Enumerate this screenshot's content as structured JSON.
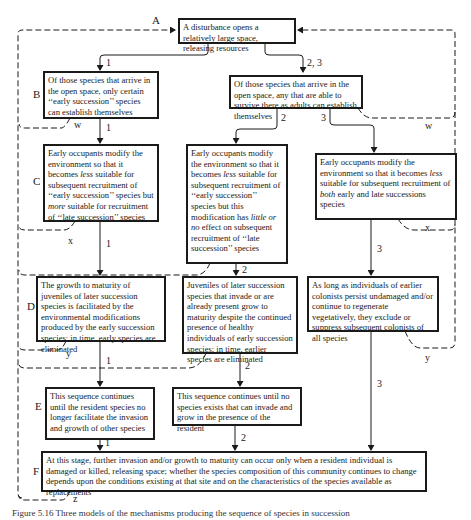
{
  "row_labels": {
    "A": "A",
    "B": "B",
    "C": "C",
    "D": "D",
    "E": "E",
    "F": "F"
  },
  "loop_labels": {
    "w_left": "w",
    "w_right": "w",
    "x_left": "x",
    "x_mid": "x",
    "x_right": "x",
    "y_left": "y",
    "y_right": "y",
    "z": "z"
  },
  "path_labels": {
    "p1_ab": "1",
    "p23": "2, 3",
    "p1_bc": "1",
    "p2": "2",
    "p3": "3",
    "p1_cd": "1",
    "p2_cd": "2",
    "p3_cd": "3",
    "p1_de": "1",
    "p2_de": "2",
    "p3_df": "3",
    "p1_ef": "1",
    "p2_ef": "2"
  },
  "boxes": {
    "A": "A disturbance opens a relatively large space, releasing resources",
    "B1": "Of those species that arrive in the open space, only certain ‘‘early succession’’ species can establish themselves",
    "B23": "Of those species that arrive in the open space, any that are able to survive there as adults can establish themselves",
    "C1_pre": "Early occupants modify the environment so that it becomes ",
    "C1_em1": "less",
    "C1_mid": " suitable for subsequent recruitment of ‘‘early succession’’ species but ",
    "C1_em2": "more",
    "C1_post": " suitable for recruitment of ‘‘late succession’’ species",
    "C2_pre": "Early occupants modify the environment so that it becomes ",
    "C2_em1": "less",
    "C2_mid": " suitable for subsequent recruitment of ‘‘early succession’’ species but this modification has ",
    "C2_em2": "little or no",
    "C2_post": " effect on subsequent recruitment of ‘‘late succession’’ species",
    "C3_pre": "Early occupants modify the environment so that it becomes ",
    "C3_em1": "less",
    "C3_mid": " suitable for subsequent recruitment of ",
    "C3_em2": "both",
    "C3_post": " early and late successions species",
    "D1": "The growth to maturity of juveniles of later succession species is facilitated by the environmental modifications produced by the early succession species; in time, early species are eliminated",
    "D2": "Juveniles of later succession species that invade or are already present grow to maturity despite the continued presence of healthy individuals of early succession species; in time, earlier species are eliminated",
    "D3": "As long as individuals of earlier colonists persist undamaged and/or continue to regenerate vegetatively, they exclude or suppress subsequent colonists of all species",
    "E1": "This sequence continues until the resident species no longer facilitate the invasion and growth of other species",
    "E2": "This sequence continues until no species exists that can invade and grow in the presence of the resident",
    "F": "At this stage, further invasion and/or growth to maturity can occur only when a resident individual is damaged or killed, releasing space; whether the species composition of this community continues to change depends upon the conditions existing at that site and on the characteristics of the species available as replacements"
  },
  "caption": "Figure 5.16   Three models of the mechanisms producing the sequence of species in succession"
}
